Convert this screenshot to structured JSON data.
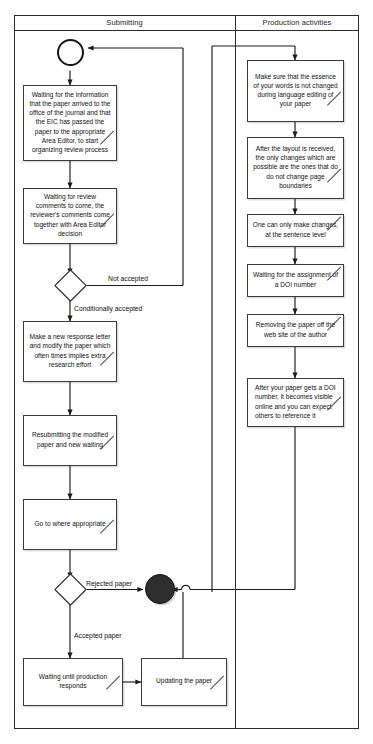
{
  "diagram": {
    "type": "uml-activity-diagram",
    "lanes": [
      {
        "id": "submitting",
        "title": "Submitting"
      },
      {
        "id": "production",
        "title": "Production activities"
      }
    ],
    "nodes": {
      "initial": "initial-node",
      "final": "final-node",
      "decision_1": "decision-node",
      "decision_2": "decision-node"
    },
    "submitting_activities": [
      {
        "id": "a1",
        "text": "Waiting for the information that the paper arrived to the office of the journal and that the EIC has passed the paper to the appropriate Area Editor, to start organizing review process"
      },
      {
        "id": "a2",
        "text": "Waiting for review comments to come, the reviewer's comments come together with Area Editor decision"
      },
      {
        "id": "a3",
        "text": "Make a new response letter and modify the paper which often times implies extra research effort"
      },
      {
        "id": "a4",
        "text": "Resubmitting the modified paper and new waiting"
      },
      {
        "id": "a5",
        "text": "Go to where appropriate"
      },
      {
        "id": "a6",
        "text": "Waiting until production responds"
      },
      {
        "id": "a7",
        "text": "Updating the paper"
      }
    ],
    "production_activities": [
      {
        "id": "p1",
        "text": "Make sure that the essence of your words is not changed during language editing of your paper"
      },
      {
        "id": "p2",
        "text": "After the layout is received, the only changes which are possible are the ones that do do not change page boundaries"
      },
      {
        "id": "p3",
        "text": "One can only make changes, at the sentence level"
      },
      {
        "id": "p4",
        "text": "Waiting for the assignment of a DOI number"
      },
      {
        "id": "p5",
        "text": "Removing the paper off the web site of the author"
      },
      {
        "id": "p6",
        "text": "After your paper gets a DOI number, it becomes visible online and you can expect others to reference it"
      }
    ],
    "edge_labels": [
      {
        "id": "e1",
        "text": "Not accepted"
      },
      {
        "id": "e2",
        "text": "Conditionally accepted"
      },
      {
        "id": "e3",
        "text": "Rejected paper"
      },
      {
        "id": "e4",
        "text": "Accepted paper"
      }
    ],
    "colors": {
      "stroke": "#2b2b2b",
      "note_border": "#3a3a3a",
      "note_fill": "#ffffff",
      "final_fill": "#2e2e2e",
      "background": "#ffffff",
      "text": "#111111"
    }
  }
}
